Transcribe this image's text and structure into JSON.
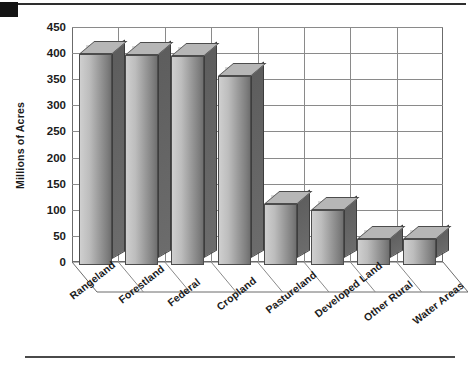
{
  "page": {
    "corner_mark": "black-registration-mark",
    "top_rule": "horizontal-rule",
    "bottom_rule": "horizontal-rule"
  },
  "chart_data": {
    "type": "bar",
    "title": "",
    "subtitle": "",
    "xlabel": "",
    "ylabel": "Millions of Acres",
    "ylim": [
      0,
      450
    ],
    "ytick_labels": [
      "0",
      "50",
      "100",
      "150",
      "200",
      "250",
      "300",
      "350",
      "400",
      "450"
    ],
    "ytick_values": [
      0,
      50,
      100,
      150,
      200,
      250,
      300,
      350,
      400,
      450
    ],
    "grid": true,
    "legend": false,
    "three_d": true,
    "categories": [
      "Rangeland",
      "Forestland",
      "Federal",
      "Cropland",
      "Pastureland",
      "Developed Land",
      "Other Rural",
      "Water Areas"
    ],
    "values": [
      405,
      402,
      400,
      362,
      117,
      105,
      50,
      50
    ],
    "bar_color": "#9a9a9a",
    "bar_top_color": "#b6b6b6",
    "bar_side_color": "#656565",
    "grid_color": "#8a8a8a",
    "frame_color": "#6b6b6b",
    "text_color": "#1b1b1b",
    "background": "#ffffff"
  }
}
